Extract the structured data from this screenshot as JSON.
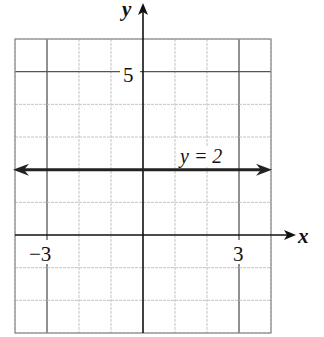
{
  "chart_data": {
    "type": "line",
    "title": "",
    "xlabel": "x",
    "ylabel": "y",
    "xlim": [
      -4,
      4
    ],
    "ylim": [
      -3,
      6
    ],
    "grid": true,
    "tick_labels": {
      "x": [
        {
          "value": -3,
          "label": "−3"
        },
        {
          "value": 3,
          "label": "3"
        }
      ],
      "y": [
        {
          "value": 5,
          "label": "5"
        }
      ]
    },
    "series": [
      {
        "name": "y = 2",
        "kind": "horizontal-line",
        "y": 2,
        "x": [
          -4,
          4
        ],
        "arrows": "both",
        "annotation": {
          "text": "y = 2",
          "x": 2.2,
          "y": 2.4
        }
      }
    ]
  },
  "labels": {
    "x_axis": "x",
    "y_axis": "y",
    "tick_x_neg3": "−3",
    "tick_x_3": "3",
    "tick_y_5": "5",
    "line_label": "y = 2"
  },
  "colors": {
    "axis": "#111111",
    "major_grid": "#555555",
    "minor_grid": "#bdbdbd",
    "border": "#888888",
    "line": "#222222"
  }
}
